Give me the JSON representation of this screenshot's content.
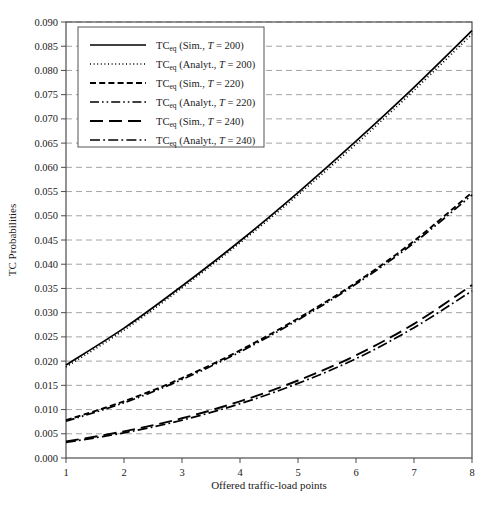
{
  "chart_data": {
    "type": "line",
    "title": "",
    "xlabel": "Offered traffic-load points",
    "ylabel": "TC Probabilities",
    "xlim": [
      1,
      8
    ],
    "ylim": [
      0.0,
      0.09
    ],
    "xticks": [
      "1",
      "2",
      "3",
      "4",
      "5",
      "6",
      "7",
      "8"
    ],
    "yticks": [
      "0.000",
      "0.005",
      "0.010",
      "0.015",
      "0.020",
      "0.025",
      "0.030",
      "0.035",
      "0.040",
      "0.045",
      "0.050",
      "0.055",
      "0.060",
      "0.065",
      "0.070",
      "0.075",
      "0.080",
      "0.085",
      "0.090"
    ],
    "grid": "horizontal-dashed",
    "legend_position": "top-left",
    "x": [
      1,
      2,
      3,
      4,
      5,
      6,
      7,
      8
    ],
    "series": [
      {
        "name": "TC_eq (Sim., T = 200)",
        "style": "solid",
        "values": [
          0.0192,
          0.0268,
          0.0355,
          0.0448,
          0.0548,
          0.0654,
          0.0765,
          0.0882
        ]
      },
      {
        "name": "TC_eq (Analyt., T = 200)",
        "style": "dotted",
        "values": [
          0.0188,
          0.0264,
          0.0351,
          0.0444,
          0.0543,
          0.0648,
          0.0759,
          0.0875
        ]
      },
      {
        "name": "TC_eq (Sim., T = 220)",
        "style": "dashed",
        "values": [
          0.0078,
          0.0117,
          0.0165,
          0.0222,
          0.0288,
          0.0362,
          0.0448,
          0.0548
        ]
      },
      {
        "name": "TC_eq (Analyt., T = 220)",
        "style": "dash-dot-dot",
        "values": [
          0.0076,
          0.0114,
          0.0162,
          0.0219,
          0.0285,
          0.0359,
          0.0444,
          0.0543
        ]
      },
      {
        "name": "TC_eq (Sim., T = 240)",
        "style": "long-dash",
        "values": [
          0.0034,
          0.0055,
          0.0082,
          0.0117,
          0.016,
          0.0212,
          0.0277,
          0.0357
        ]
      },
      {
        "name": "TC_eq (Analyt., T = 240)",
        "style": "dash-dot",
        "values": [
          0.0032,
          0.0052,
          0.0078,
          0.0112,
          0.0154,
          0.0205,
          0.0269,
          0.0345
        ]
      }
    ]
  },
  "legend": {
    "entries": [
      {
        "prefix": "TC",
        "sub": "eq",
        "rest": "(Sim., ",
        "var": "T",
        "eq": " = 200)",
        "style": "solid"
      },
      {
        "prefix": "TC",
        "sub": "eq",
        "rest": "(Analyt., ",
        "var": "T",
        "eq": " = 200)",
        "style": "dotted"
      },
      {
        "prefix": "TC",
        "sub": "eq",
        "rest": "(Sim., ",
        "var": "T",
        "eq": " = 220)",
        "style": "dashed"
      },
      {
        "prefix": "TC",
        "sub": "eq",
        "rest": "(Analyt., ",
        "var": "T",
        "eq": " = 220)",
        "style": "dash-dot-dot"
      },
      {
        "prefix": "TC",
        "sub": "eq",
        "rest": "(Sim., ",
        "var": "T",
        "eq": " = 240)",
        "style": "long-dash"
      },
      {
        "prefix": "TC",
        "sub": "eq",
        "rest": "(Analyt., ",
        "var": "T",
        "eq": " = 240)",
        "style": "dash-dot"
      }
    ]
  },
  "colors": {
    "line": "#000000",
    "grid": "#9a9a9a",
    "axis": "#4d4d4d",
    "background": "#ffffff",
    "text": "#1a1a1a"
  }
}
